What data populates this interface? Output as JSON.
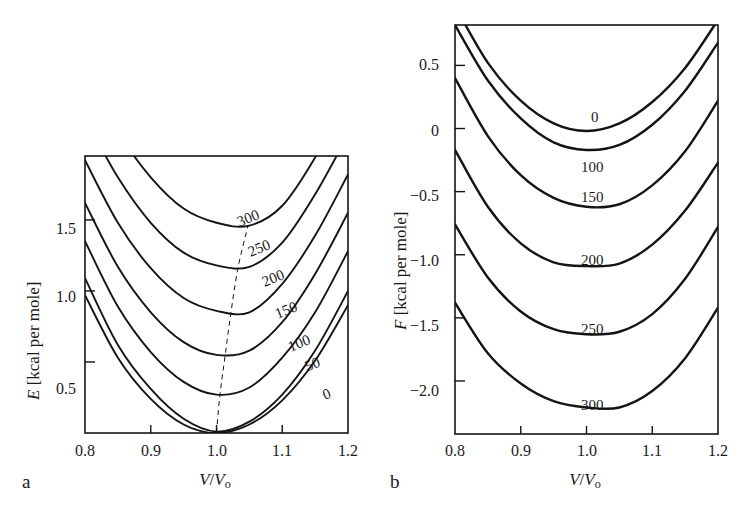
{
  "figure": {
    "panel_a_letter": "a",
    "panel_b_letter": "b"
  },
  "panel_a": {
    "ylabel_var": "E",
    "ylabel_unit": "[kcal per mole]",
    "xlabel_num": "V",
    "xlabel_den": "V",
    "xlabel_sub": "o",
    "yticks": [
      "0.5",
      "1.0",
      "1.5"
    ],
    "xticks": [
      "0.8",
      "0.9",
      "1.0",
      "1.1",
      "1.2"
    ],
    "curve_labels": [
      "300",
      "250",
      "200",
      "150",
      "100",
      "50",
      "0"
    ]
  },
  "panel_b": {
    "ylabel_var": "F",
    "ylabel_unit": "[kcal per mole]",
    "xlabel_num": "V",
    "xlabel_den": "V",
    "xlabel_sub": "o",
    "yticks": [
      "0.5",
      "0",
      "−0.5",
      "−1.0",
      "−1.5",
      "−2.0"
    ],
    "xticks": [
      "0.8",
      "0.9",
      "1.0",
      "1.1",
      "1.2"
    ],
    "curve_labels": [
      "0",
      "100",
      "150",
      "200",
      "250",
      "300"
    ]
  },
  "chart_data": [
    {
      "id": "panel-a",
      "type": "line",
      "title": "",
      "xlabel": "V/Vo",
      "ylabel": "E [kcal per mole]",
      "xlim": [
        0.8,
        1.2
      ],
      "ylim": [
        0.0,
        1.95
      ],
      "xticks": [
        0.8,
        0.9,
        1.0,
        1.1,
        1.2
      ],
      "yticks": [
        0.5,
        1.0,
        1.5
      ],
      "grid": false,
      "legend": "inline-curve-labels",
      "series_units": "temperature in K",
      "series": [
        {
          "name": "0",
          "minimum_x": 1.0,
          "minimum_y": 0.0,
          "x": [
            0.8,
            0.85,
            0.9,
            0.95,
            1.0,
            1.05,
            1.1,
            1.15,
            1.2
          ],
          "y": [
            0.97,
            0.53,
            0.24,
            0.06,
            0.0,
            0.06,
            0.23,
            0.51,
            0.9
          ]
        },
        {
          "name": "50",
          "minimum_x": 1.002,
          "minimum_y": 0.01,
          "x": [
            0.8,
            0.85,
            0.9,
            0.95,
            1.0,
            1.05,
            1.1,
            1.15,
            1.2
          ],
          "y": [
            1.09,
            0.62,
            0.31,
            0.1,
            0.01,
            0.08,
            0.27,
            0.58,
            1.0
          ]
        },
        {
          "name": "100",
          "minimum_x": 1.005,
          "minimum_y": 0.26,
          "x": [
            0.8,
            0.85,
            0.9,
            0.95,
            1.0,
            1.05,
            1.1,
            1.15,
            1.2
          ],
          "y": [
            1.35,
            0.89,
            0.57,
            0.36,
            0.27,
            0.32,
            0.53,
            0.85,
            1.28
          ]
        },
        {
          "name": "150",
          "minimum_x": 1.012,
          "minimum_y": 0.54,
          "x": [
            0.8,
            0.85,
            0.9,
            0.95,
            1.0,
            1.05,
            1.1,
            1.15,
            1.2
          ],
          "y": [
            1.62,
            1.17,
            0.85,
            0.64,
            0.55,
            0.58,
            0.78,
            1.12,
            1.55
          ]
        },
        {
          "name": "200",
          "minimum_x": 1.02,
          "minimum_y": 0.84,
          "x": [
            0.8,
            0.85,
            0.9,
            0.95,
            1.0,
            1.05,
            1.1,
            1.15,
            1.2
          ],
          "y": [
            1.92,
            1.48,
            1.16,
            0.95,
            0.86,
            0.85,
            1.05,
            1.39,
            1.82
          ]
        },
        {
          "name": "250",
          "minimum_x": 1.03,
          "minimum_y": 1.16,
          "x": [
            0.8,
            0.85,
            0.9,
            0.95,
            1.0,
            1.05,
            1.1,
            1.15,
            1.2
          ],
          "y": [
            2.22,
            1.8,
            1.48,
            1.27,
            1.18,
            1.17,
            1.34,
            1.68,
            2.1
          ]
        },
        {
          "name": "300",
          "minimum_x": 1.045,
          "minimum_y": 1.45,
          "x": [
            0.8,
            0.85,
            0.9,
            0.95,
            1.0,
            1.05,
            1.1,
            1.15,
            1.2
          ],
          "y": [
            2.55,
            2.12,
            1.8,
            1.58,
            1.48,
            1.46,
            1.6,
            1.94,
            2.38
          ]
        }
      ],
      "annotations": [
        {
          "type": "dashed-line",
          "label": "locus of minima",
          "x": [
            1.0,
            1.005,
            1.013,
            1.022,
            1.033,
            1.048
          ],
          "y": [
            0.0,
            0.26,
            0.54,
            0.85,
            1.17,
            1.46
          ]
        }
      ]
    },
    {
      "id": "panel-b",
      "type": "line",
      "title": "",
      "xlabel": "V/Vo",
      "ylabel": "F [kcal per mole]",
      "xlim": [
        0.8,
        1.2
      ],
      "ylim": [
        -2.42,
        0.82
      ],
      "xticks": [
        0.8,
        0.9,
        1.0,
        1.1,
        1.2
      ],
      "yticks": [
        0.5,
        0,
        -0.5,
        -1.0,
        -1.5,
        -2.0
      ],
      "grid": false,
      "legend": "inline-curve-labels",
      "series_units": "temperature in K",
      "series": [
        {
          "name": "0",
          "minimum_x": 1.002,
          "minimum_y": -0.02,
          "x": [
            0.8,
            0.85,
            0.9,
            0.95,
            1.0,
            1.05,
            1.1,
            1.15,
            1.2
          ],
          "y": [
            0.97,
            0.52,
            0.22,
            0.04,
            -0.02,
            0.04,
            0.21,
            0.48,
            0.86
          ]
        },
        {
          "name": "100",
          "minimum_x": 1.018,
          "minimum_y": -0.18,
          "x": [
            0.8,
            0.85,
            0.9,
            0.95,
            1.0,
            1.05,
            1.1,
            1.15,
            1.2
          ],
          "y": [
            0.82,
            0.38,
            0.08,
            -0.11,
            -0.17,
            -0.13,
            0.03,
            0.3,
            0.68
          ]
        },
        {
          "name": "150",
          "minimum_x": 1.03,
          "minimum_y": -0.63,
          "x": [
            0.8,
            0.85,
            0.9,
            0.95,
            1.0,
            1.05,
            1.1,
            1.15,
            1.2
          ],
          "y": [
            0.4,
            -0.06,
            -0.37,
            -0.55,
            -0.62,
            -0.6,
            -0.45,
            -0.18,
            0.22
          ]
        },
        {
          "name": "200",
          "minimum_x": 1.038,
          "minimum_y": -1.09,
          "x": [
            0.8,
            0.85,
            0.9,
            0.95,
            1.0,
            1.05,
            1.1,
            1.15,
            1.2
          ],
          "y": [
            -0.17,
            -0.62,
            -0.91,
            -1.06,
            -1.09,
            -1.07,
            -0.92,
            -0.65,
            -0.27
          ]
        },
        {
          "name": "250",
          "minimum_x": 1.042,
          "minimum_y": -1.63,
          "x": [
            0.8,
            0.85,
            0.9,
            0.95,
            1.0,
            1.05,
            1.1,
            1.15,
            1.2
          ],
          "y": [
            -0.76,
            -1.18,
            -1.45,
            -1.59,
            -1.63,
            -1.61,
            -1.47,
            -1.19,
            -0.78
          ]
        },
        {
          "name": "300",
          "minimum_x": 1.046,
          "minimum_y": -2.22,
          "x": [
            0.8,
            0.85,
            0.9,
            0.95,
            1.0,
            1.05,
            1.1,
            1.15,
            1.2
          ],
          "y": [
            -1.38,
            -1.78,
            -2.02,
            -2.16,
            -2.21,
            -2.21,
            -2.08,
            -1.82,
            -1.42
          ]
        }
      ]
    }
  ]
}
